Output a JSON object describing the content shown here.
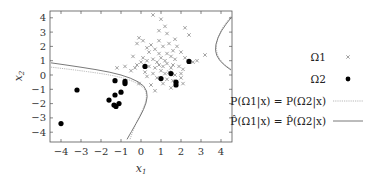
{
  "chart_data": {
    "type": "scatter",
    "title": "",
    "xlabel": "x1",
    "ylabel": "x2",
    "xlim": [
      -4.5,
      4.5
    ],
    "ylim": [
      -4.5,
      4.6
    ],
    "xticks": [
      -4,
      -3,
      -2,
      -1,
      0,
      1,
      2,
      3,
      4
    ],
    "yticks": [
      -4,
      -3,
      -2,
      -1,
      0,
      1,
      2,
      3,
      4
    ],
    "xtick_labels": [
      "−4",
      "−3",
      "−2",
      "−1",
      "0",
      "1",
      "2",
      "3",
      "4"
    ],
    "ytick_labels": [
      "−4",
      "−3",
      "−2",
      "−1",
      "0",
      "1",
      "2",
      "3",
      "4"
    ],
    "grid": false,
    "legend_position": "right",
    "series": [
      {
        "name": "Ω1",
        "marker": "cross",
        "color": "#8a8a8a",
        "points": [
          [
            0.6,
            4.2
          ],
          [
            1.0,
            3.9
          ],
          [
            1.2,
            3.4
          ],
          [
            0.9,
            3.1
          ],
          [
            2.2,
            3.3
          ],
          [
            2.4,
            2.8
          ],
          [
            1.3,
            2.9
          ],
          [
            -0.1,
            2.6
          ],
          [
            0.1,
            2.4
          ],
          [
            -0.2,
            2.2
          ],
          [
            0.5,
            2.1
          ],
          [
            1.1,
            2.0
          ],
          [
            1.4,
            2.2
          ],
          [
            1.8,
            2.0
          ],
          [
            1.7,
            2.5
          ],
          [
            0.7,
            1.8
          ],
          [
            0.4,
            1.6
          ],
          [
            0.9,
            1.5
          ],
          [
            1.3,
            1.5
          ],
          [
            2.0,
            1.6
          ],
          [
            3.2,
            1.4
          ],
          [
            -0.4,
            1.3
          ],
          [
            0.1,
            1.2
          ],
          [
            0.3,
            1.0
          ],
          [
            0.6,
            1.1
          ],
          [
            0.8,
            0.9
          ],
          [
            1.0,
            1.2
          ],
          [
            1.2,
            1.0
          ],
          [
            1.5,
            1.3
          ],
          [
            1.7,
            1.1
          ],
          [
            2.2,
            1.2
          ],
          [
            2.6,
            0.9
          ],
          [
            2.8,
            1.0
          ],
          [
            0.0,
            0.9
          ],
          [
            -0.2,
            0.7
          ],
          [
            0.4,
            0.6
          ],
          [
            0.7,
            0.5
          ],
          [
            0.9,
            0.7
          ],
          [
            1.1,
            0.6
          ],
          [
            1.3,
            0.8
          ],
          [
            1.5,
            0.5
          ],
          [
            1.6,
            0.7
          ],
          [
            1.9,
            0.6
          ],
          [
            2.1,
            0.4
          ],
          [
            -0.8,
            0.6
          ],
          [
            -1.2,
            0.5
          ],
          [
            -0.5,
            0.3
          ],
          [
            0.2,
            0.2
          ],
          [
            0.6,
            0.1
          ],
          [
            1.0,
            0.3
          ],
          [
            1.2,
            0.1
          ],
          [
            1.4,
            0.2
          ],
          [
            1.7,
            0.0
          ],
          [
            2.0,
            0.1
          ],
          [
            0.3,
            -0.1
          ],
          [
            0.8,
            -0.2
          ],
          [
            1.3,
            -0.3
          ],
          [
            1.6,
            -0.4
          ],
          [
            2.0,
            -0.2
          ],
          [
            -0.1,
            -0.6
          ],
          [
            0.5,
            -0.7
          ],
          [
            1.1,
            -0.6
          ],
          [
            1.5,
            -0.9
          ],
          [
            2.1,
            -0.6
          ],
          [
            0.7,
            -1.1
          ],
          [
            -0.3,
            0.5
          ],
          [
            0.9,
            2.4
          ],
          [
            1.6,
            1.7
          ],
          [
            0.3,
            1.9
          ],
          [
            2.4,
            0.9
          ]
        ]
      },
      {
        "name": "Ω2",
        "marker": "dot",
        "color": "#000000",
        "points": [
          [
            -4.0,
            -3.4
          ],
          [
            -3.2,
            -1.05
          ],
          [
            -1.3,
            -0.4
          ],
          [
            -0.8,
            -0.45
          ],
          [
            -0.8,
            -0.6
          ],
          [
            -1.0,
            -1.2
          ],
          [
            -1.3,
            -1.4
          ],
          [
            -1.6,
            -1.75
          ],
          [
            -1.1,
            -2.0
          ],
          [
            -1.35,
            -2.1
          ],
          [
            -1.25,
            -2.2
          ],
          [
            0.2,
            0.6
          ],
          [
            1.0,
            -0.25
          ],
          [
            1.5,
            0.1
          ],
          [
            1.75,
            -0.5
          ],
          [
            1.75,
            -0.7
          ],
          [
            2.4,
            0.95
          ]
        ]
      }
    ],
    "curves": [
      {
        "name": "P(Ω1|x) = P(Ω2|x)",
        "style": "dotted",
        "color": "#9a9a9a",
        "segments": [
          [
            [
              -4.5,
              0.55
            ],
            [
              -3.0,
              0.3
            ],
            [
              -1.5,
              0.0
            ],
            [
              -0.5,
              -0.35
            ],
            [
              0.2,
              -0.9
            ],
            [
              0.3,
              -1.6
            ],
            [
              0.1,
              -2.4
            ],
            [
              -0.3,
              -3.5
            ],
            [
              -0.55,
              -4.5
            ]
          ],
          [
            [
              4.5,
              4.1
            ],
            [
              4.0,
              3.2
            ],
            [
              3.75,
              2.2
            ],
            [
              3.8,
              1.4
            ],
            [
              4.1,
              0.8
            ],
            [
              4.5,
              0.4
            ]
          ]
        ]
      },
      {
        "name": "P̂(Ω1|x) = P̂(Ω2|x)",
        "style": "solid",
        "color": "#6a6a6a",
        "segments": [
          [
            [
              -4.5,
              0.85
            ],
            [
              -3.0,
              0.55
            ],
            [
              -1.5,
              0.2
            ],
            [
              -0.5,
              -0.2
            ],
            [
              0.2,
              -0.75
            ],
            [
              0.35,
              -1.5
            ],
            [
              0.15,
              -2.4
            ],
            [
              -0.25,
              -3.4
            ],
            [
              -0.7,
              -4.5
            ]
          ],
          [
            [
              4.5,
              4.0
            ],
            [
              4.0,
              3.1
            ],
            [
              3.7,
              2.1
            ],
            [
              3.75,
              1.35
            ],
            [
              4.1,
              0.75
            ],
            [
              4.5,
              0.35
            ]
          ]
        ]
      }
    ]
  },
  "legend": {
    "items": [
      {
        "label": "Ω1",
        "marker": "cross"
      },
      {
        "label": "Ω2",
        "marker": "dot"
      },
      {
        "label": "P(Ω1|x) = P(Ω2|x)",
        "marker": "dotted-line"
      },
      {
        "label": "P̂(Ω1|x) = P̂(Ω2|x)",
        "marker": "solid-line"
      }
    ]
  }
}
